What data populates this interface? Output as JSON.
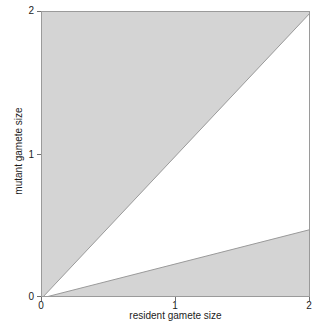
{
  "chart_data": {
    "type": "area",
    "title": "",
    "xlabel": "resident gamete size",
    "ylabel": "mutant gamete size",
    "xlim": [
      0,
      2
    ],
    "ylim": [
      0,
      2
    ],
    "xticks": [
      {
        "value": 0,
        "label": "0"
      },
      {
        "value": 1,
        "label": "1"
      },
      {
        "value": 2,
        "label": "2"
      }
    ],
    "yticks": [
      {
        "value": 0,
        "label": "0"
      },
      {
        "value": 1,
        "label": "1"
      },
      {
        "value": 2,
        "label": "2"
      }
    ],
    "grid": false,
    "legend": "none",
    "shaded_color": "#d4d4d4",
    "unshaded_color": "#ffffff",
    "line_color": "#9a9a9a",
    "frame_color": "#9a9a9a",
    "regions": [
      {
        "name": "upper-shaded-region",
        "description": "Shaded region above the diagonal line mutant = resident",
        "fill": "#d4d4d4",
        "boundary_line": {
          "name": "diagonal-identity-line",
          "slope": 1,
          "intercept": 0
        },
        "polygon_xy": [
          [
            0,
            0
          ],
          [
            2,
            2
          ],
          [
            0,
            2
          ]
        ]
      },
      {
        "name": "lower-shaded-region",
        "description": "Shaded region below the shallow line from origin",
        "fill": "#d4d4d4",
        "boundary_line": {
          "name": "shallow-invasion-boundary",
          "slope": 0.24,
          "intercept": 0
        },
        "polygon_xy": [
          [
            0,
            0
          ],
          [
            2,
            0.48
          ],
          [
            2,
            0
          ],
          [
            0,
            0
          ]
        ]
      },
      {
        "name": "white-region",
        "description": "Unshaded wedge between the shallow boundary and the diagonal",
        "fill": "#ffffff",
        "polygon_xy": [
          [
            0,
            0
          ],
          [
            2,
            2
          ],
          [
            2,
            0.48
          ]
        ]
      }
    ],
    "series": [
      {
        "name": "diagonal-identity-line",
        "type": "line",
        "x": [
          0,
          2
        ],
        "y": [
          0,
          2
        ]
      },
      {
        "name": "shallow-invasion-boundary",
        "type": "line",
        "x": [
          0,
          2
        ],
        "y": [
          0,
          0.48
        ]
      }
    ]
  }
}
